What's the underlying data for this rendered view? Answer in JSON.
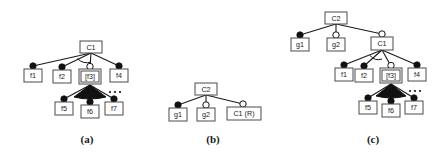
{
  "figure": {
    "background_color": "#ffffff",
    "line_color": "#1a1a1a",
    "box_stroke_color": "#4a4a4a",
    "decorator_filled_color": "#111111",
    "decorator_hollow_color": "#ffffff"
  },
  "panels": [
    {
      "id": "a",
      "caption": "(a)",
      "root": "C1",
      "nodes": [
        {
          "id": "a-C1",
          "label": "C1",
          "decorator": "none",
          "selected": false
        },
        {
          "id": "a-f1",
          "label": "f1",
          "decorator": "filled",
          "selected": false
        },
        {
          "id": "a-f2",
          "label": "f2",
          "decorator": "filled",
          "selected": false
        },
        {
          "id": "a-f3",
          "label": "[f3]",
          "decorator": "hollow",
          "selected": true
        },
        {
          "id": "a-f4",
          "label": "f4",
          "decorator": "filled",
          "selected": false
        },
        {
          "id": "a-f5",
          "label": "f5",
          "decorator": "filled",
          "selected": false
        },
        {
          "id": "a-f6",
          "label": "f6",
          "decorator": "filled",
          "selected": false
        },
        {
          "id": "a-f7",
          "label": "f7",
          "decorator": "filled",
          "selected": false
        }
      ],
      "edges": [
        {
          "from": "a-C1",
          "to": "a-f1"
        },
        {
          "from": "a-C1",
          "to": "a-f2"
        },
        {
          "from": "a-C1",
          "to": "a-f3"
        },
        {
          "from": "a-C1",
          "to": "a-f4"
        },
        {
          "from": "a-f3",
          "to": "a-f5"
        },
        {
          "from": "a-f3",
          "to": "a-f6"
        },
        {
          "from": "a-f3",
          "to": "a-f7"
        }
      ],
      "groups": [
        {
          "parent": "a-C1",
          "type": "alternative-arc-hollow"
        },
        {
          "parent": "a-f3",
          "type": "or-fan-filled"
        }
      ],
      "ellipsis": true
    },
    {
      "id": "b",
      "caption": "(b)",
      "root": "C2",
      "nodes": [
        {
          "id": "b-C2",
          "label": "C2",
          "decorator": "none",
          "selected": false
        },
        {
          "id": "b-g1",
          "label": "g1",
          "decorator": "filled",
          "selected": false
        },
        {
          "id": "b-g2",
          "label": "g2",
          "decorator": "hollow",
          "selected": false
        },
        {
          "id": "b-C1R",
          "label": "C1 (R)",
          "decorator": "hollow",
          "selected": false
        }
      ],
      "edges": [
        {
          "from": "b-C2",
          "to": "b-g1"
        },
        {
          "from": "b-C2",
          "to": "b-g2"
        },
        {
          "from": "b-C2",
          "to": "b-C1R"
        }
      ],
      "groups": [],
      "ellipsis": false
    },
    {
      "id": "c",
      "caption": "(c)",
      "root": "C2",
      "nodes": [
        {
          "id": "c-C2",
          "label": "C2",
          "decorator": "none",
          "selected": false
        },
        {
          "id": "c-g1",
          "label": "g1",
          "decorator": "filled",
          "selected": false
        },
        {
          "id": "c-g2",
          "label": "g2",
          "decorator": "hollow",
          "selected": false
        },
        {
          "id": "c-C1",
          "label": "C1",
          "decorator": "hollow",
          "selected": false
        },
        {
          "id": "c-f1",
          "label": "f1",
          "decorator": "filled",
          "selected": false
        },
        {
          "id": "c-f2",
          "label": "f2",
          "decorator": "filled",
          "selected": false
        },
        {
          "id": "c-f3",
          "label": "[f3]",
          "decorator": "hollow",
          "selected": true
        },
        {
          "id": "c-f4",
          "label": "f4",
          "decorator": "filled",
          "selected": false
        },
        {
          "id": "c-f5",
          "label": "f5",
          "decorator": "filled",
          "selected": false
        },
        {
          "id": "c-f6",
          "label": "f6",
          "decorator": "filled",
          "selected": false
        },
        {
          "id": "c-f7",
          "label": "f7",
          "decorator": "filled",
          "selected": false
        }
      ],
      "edges": [
        {
          "from": "c-C2",
          "to": "c-g1"
        },
        {
          "from": "c-C2",
          "to": "c-g2"
        },
        {
          "from": "c-C2",
          "to": "c-C1"
        },
        {
          "from": "c-C1",
          "to": "c-f1"
        },
        {
          "from": "c-C1",
          "to": "c-f2"
        },
        {
          "from": "c-C1",
          "to": "c-f3"
        },
        {
          "from": "c-C1",
          "to": "c-f4"
        },
        {
          "from": "c-f3",
          "to": "c-f5"
        },
        {
          "from": "c-f3",
          "to": "c-f6"
        },
        {
          "from": "c-f3",
          "to": "c-f7"
        }
      ],
      "groups": [
        {
          "parent": "c-C1",
          "type": "alternative-arc-hollow"
        },
        {
          "parent": "c-f3",
          "type": "or-fan-filled"
        }
      ],
      "ellipsis": true
    }
  ],
  "labels": {
    "a_C1": "C1",
    "a_f1": "f1",
    "a_f2": "f2",
    "a_f3": "[f3]",
    "a_f4": "f4",
    "a_f5": "f5",
    "a_f6": "f6",
    "a_f7": "f7",
    "a_caption": "(a)",
    "b_C2": "C2",
    "b_g1": "g1",
    "b_g2": "g2",
    "b_C1R": "C1 (R)",
    "b_caption": "(b)",
    "c_C2": "C2",
    "c_g1": "g1",
    "c_g2": "g2",
    "c_C1": "C1",
    "c_f1": "f1",
    "c_f2": "f2",
    "c_f3": "[f3]",
    "c_f4": "f4",
    "c_f5": "f5",
    "c_f6": "f6",
    "c_f7": "f7",
    "c_caption": "(c)"
  }
}
